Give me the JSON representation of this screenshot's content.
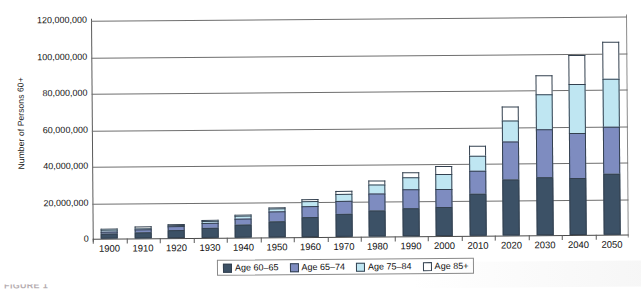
{
  "chart_data": {
    "type": "bar",
    "subtype": "stacked-bar",
    "title": "",
    "xlabel": "",
    "ylabel": "Number of Persons 60+",
    "categories": [
      "1900",
      "1910",
      "1920",
      "1930",
      "1940",
      "1950",
      "1960",
      "1970",
      "1980",
      "1990",
      "2000",
      "2010",
      "2020",
      "2030",
      "2040",
      "2050"
    ],
    "series": [
      {
        "name": "Age 60–65",
        "color": "#3c5166",
        "values": [
          2700000,
          3400000,
          4300000,
          5500000,
          7000000,
          9000000,
          11000000,
          12500000,
          14500000,
          15500000,
          16000000,
          23000000,
          30500000,
          32000000,
          31500000,
          33500000
        ]
      },
      {
        "name": "Age 65–74",
        "color": "#7e8cc0",
        "values": [
          1400000,
          1700000,
          2100000,
          2800000,
          3600000,
          5000000,
          6100000,
          7300000,
          9000000,
          10000000,
          10000000,
          12500000,
          21000000,
          26000000,
          24500000,
          25500000
        ]
      },
      {
        "name": "Age 75–84",
        "color": "#bfe6f2",
        "values": [
          500000,
          600000,
          800000,
          1000000,
          1300000,
          1800000,
          2700000,
          3800000,
          5200000,
          6800000,
          8000000,
          8500000,
          11500000,
          19500000,
          27000000,
          26500000
        ]
      },
      {
        "name": "Age 85+",
        "color": "#ffffff",
        "values": [
          200000,
          250000,
          300000,
          400000,
          500000,
          700000,
          1000000,
          1400000,
          2200000,
          3000000,
          4200000,
          5500000,
          7500000,
          10000000,
          15500000,
          20500000
        ]
      }
    ],
    "ylim": [
      0,
      120000000
    ],
    "ytick_labels": [
      "120,000,000",
      "100,000,000",
      "80,000,000",
      "60,000,000",
      "40,000,000",
      "20,000,000",
      "0"
    ],
    "ytick_values": [
      120000000,
      100000000,
      80000000,
      60000000,
      40000000,
      20000000,
      0
    ],
    "grid": true,
    "legend_position": "bottom",
    "legend": [
      "Age 60–65",
      "Age 65–74",
      "Age 75–84",
      "Age 85+"
    ],
    "totals": [
      4800000,
      5950000,
      7500000,
      9700000,
      12400000,
      16500000,
      20800000,
      25000000,
      30900000,
      35300000,
      38200000,
      49500000,
      70500000,
      87500000,
      98500000,
      106000000
    ]
  },
  "caption": {
    "text": "FIGURE 1"
  }
}
